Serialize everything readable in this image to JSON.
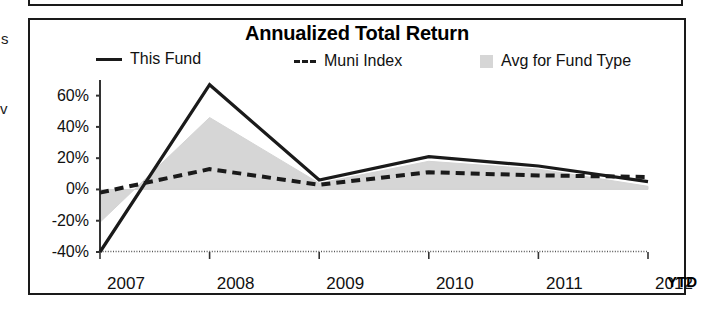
{
  "chart_data": {
    "type": "line",
    "title": "Annualized Total Return",
    "xlabel": "",
    "ylabel": "",
    "categories": [
      "2007",
      "2008",
      "2009",
      "2010",
      "2011",
      "2012"
    ],
    "x_axis_suffix": "YTD",
    "ylim": [
      -40,
      70
    ],
    "yticks": [
      60,
      40,
      20,
      0,
      -20,
      -40
    ],
    "ytick_labels": [
      "60%",
      "40%",
      "20%",
      "0%",
      "-20%",
      "-40%"
    ],
    "grid": false,
    "legend_position": "top",
    "series": [
      {
        "name": "This Fund",
        "style": "solid",
        "color": "#1a1a1a",
        "values": [
          -40,
          67,
          6,
          21,
          15,
          5
        ]
      },
      {
        "name": "Muni Index",
        "style": "dashed",
        "color": "#1a1a1a",
        "values": [
          -2,
          13,
          3,
          11,
          9,
          8
        ]
      },
      {
        "name": "Avg for Fund Type",
        "style": "filled-area",
        "color": "#d4d4d4",
        "values": [
          -21,
          46,
          4,
          18,
          13,
          2
        ]
      }
    ]
  },
  "legend": {
    "items": [
      {
        "label": "This Fund",
        "marker": "solid-line-icon"
      },
      {
        "label": "Muni Index",
        "marker": "dashed-line-icon"
      },
      {
        "label": "Avg for Fund Type",
        "marker": "gray-swatch-icon"
      }
    ]
  },
  "artifacts": {
    "left_fragment_top": "s",
    "left_fragment_mid": "v"
  },
  "colors": {
    "line": "#1a1a1a",
    "area_fill": "#d4d4d4",
    "frame": "#1a1a1a",
    "background": "#ffffff"
  }
}
